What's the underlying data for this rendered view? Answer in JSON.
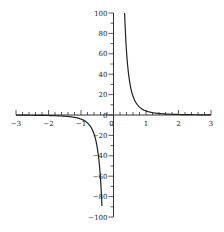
{
  "chart_data": {
    "type": "line",
    "title": "",
    "xlabel": "",
    "ylabel": "",
    "xlim": [
      -3,
      3
    ],
    "ylim": [
      -100,
      100
    ],
    "grid": false,
    "legend": null,
    "x_ticks": [
      "-3",
      "-2",
      "-1",
      "0",
      "1",
      "2",
      "3"
    ],
    "y_ticks": [
      "100",
      "80",
      "60",
      "40",
      "20",
      "0",
      "-20",
      "-40",
      "-60",
      "-80",
      "-100"
    ],
    "series": [
      {
        "name": "f(x) = 4/x^3",
        "color": "#222222",
        "x": [
          -3,
          -2,
          -1.5,
          -1,
          -0.8,
          -0.6,
          -0.5,
          -0.45,
          -0.4,
          -0.35,
          -0.342,
          0.342,
          0.35,
          0.4,
          0.45,
          0.5,
          0.6,
          0.8,
          1,
          1.5,
          2,
          3
        ],
        "y": [
          -0.15,
          -0.5,
          -1.19,
          -4,
          -7.8,
          -18.5,
          -32,
          -43.9,
          -62.5,
          -93.3,
          -100,
          100,
          93.3,
          62.5,
          43.9,
          32,
          18.5,
          7.8,
          4,
          1.19,
          0.5,
          0.15
        ]
      }
    ]
  }
}
